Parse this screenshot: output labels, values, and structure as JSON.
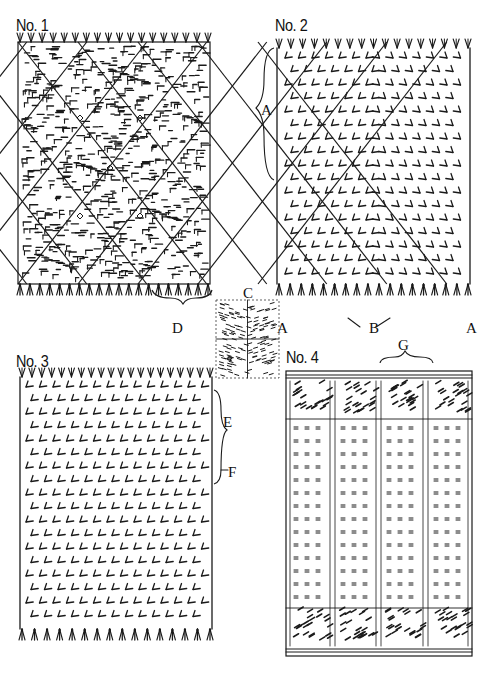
{
  "figure": {
    "panels": [
      {
        "id": "no1",
        "title": "No. 1",
        "pattern": "diamond-lattice"
      },
      {
        "id": "no2",
        "title": "No. 2",
        "pattern": "concentric-diamond-chevrons"
      },
      {
        "id": "no3",
        "title": "No. 3",
        "pattern": "diagonal-chevron-bands"
      },
      {
        "id": "no4",
        "title": "No. 4",
        "pattern": "vertical-stripes-with-end-borders"
      }
    ],
    "center_detail": {
      "label": "C",
      "pattern": "quartered-dash-weave"
    },
    "annotations": {
      "A_left": "A",
      "A_bottom_left": "A",
      "A_bottom_right": "A",
      "B": "B",
      "D": "D",
      "E": "E",
      "F": "F",
      "G": "G"
    },
    "colors": {
      "ink": "#1a1a1a",
      "paper": "#ffffff"
    }
  }
}
